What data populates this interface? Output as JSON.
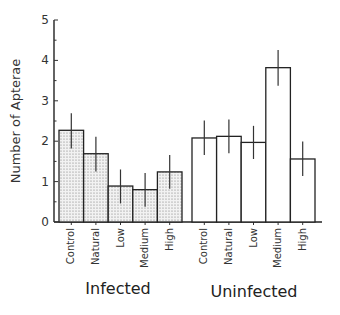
{
  "chart_data": {
    "type": "bar",
    "title": "",
    "xlabel": "",
    "ylabel": "Number of Apterae",
    "ylim": [
      0,
      5
    ],
    "yticks": [
      0,
      1,
      2,
      3,
      4,
      5
    ],
    "grid": false,
    "legend": null,
    "groups": [
      "Infected",
      "Uninfected"
    ],
    "categories": [
      "Control",
      "Natural",
      "Low",
      "Medium",
      "High"
    ],
    "series": [
      {
        "name": "Infected",
        "fill": "stippled-gray",
        "values": [
          2.27,
          1.69,
          0.89,
          0.8,
          1.24
        ],
        "error_low": [
          1.82,
          1.25,
          0.46,
          0.38,
          0.82
        ],
        "error_high": [
          2.69,
          2.11,
          1.3,
          1.21,
          1.66
        ]
      },
      {
        "name": "Uninfected",
        "fill": "white",
        "values": [
          2.08,
          2.12,
          1.97,
          3.82,
          1.56
        ],
        "error_low": [
          1.66,
          1.7,
          1.56,
          3.37,
          1.14
        ],
        "error_high": [
          2.51,
          2.54,
          2.38,
          4.26,
          1.99
        ]
      }
    ]
  },
  "labels": {
    "ylabel": "Number of Apterae",
    "group_infected": "Infected",
    "group_uninfected": "Uninfected"
  }
}
